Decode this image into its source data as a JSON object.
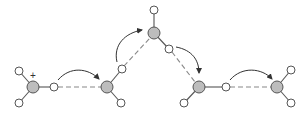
{
  "diagram": {
    "type": "proton-hopping (Grotthuss) mechanism",
    "charge_label": "+",
    "colors": {
      "heavy_atom": "#bdbdbd",
      "light_atom": "#ffffff",
      "outline": "#555555"
    },
    "molecules": 5,
    "arrows": 4
  }
}
